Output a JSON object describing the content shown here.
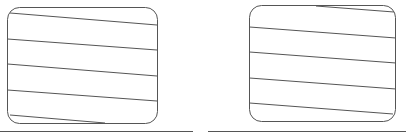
{
  "diagram": {
    "stroke_color": "#555555",
    "background": "#ffffff",
    "panels": [
      {
        "name": "left-box",
        "box": {
          "x": 7.5,
          "y": 7.5,
          "w": 150,
          "h": 116,
          "r": 12
        },
        "lines": [
          {
            "x1": 10,
            "y1": 13,
            "x2": 157,
            "y2": 25
          },
          {
            "x1": 7.5,
            "y1": 39,
            "x2": 157,
            "y2": 50
          },
          {
            "x1": 7.5,
            "y1": 64,
            "x2": 157,
            "y2": 76
          },
          {
            "x1": 7.5,
            "y1": 90,
            "x2": 157,
            "y2": 101
          },
          {
            "x1": 10,
            "y1": 115,
            "x2": 105,
            "y2": 123
          }
        ],
        "baseline": {
          "x1": 0,
          "y1": 131,
          "x2": 193,
          "y2": 131
        }
      },
      {
        "name": "right-box",
        "box": {
          "x": 249.5,
          "y": 5.5,
          "w": 146,
          "h": 116,
          "r": 12
        },
        "lines": [
          {
            "x1": 316,
            "y1": 6,
            "x2": 394,
            "y2": 12
          },
          {
            "x1": 249.5,
            "y1": 27,
            "x2": 396,
            "y2": 38
          },
          {
            "x1": 249.5,
            "y1": 52,
            "x2": 396,
            "y2": 63
          },
          {
            "x1": 249.5,
            "y1": 78,
            "x2": 396,
            "y2": 89
          },
          {
            "x1": 249.5,
            "y1": 103,
            "x2": 393,
            "y2": 114
          }
        ],
        "baseline": {
          "x1": 208,
          "y1": 131,
          "x2": 406,
          "y2": 131
        }
      }
    ]
  }
}
